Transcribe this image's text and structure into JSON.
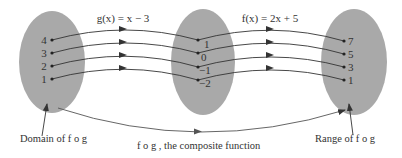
{
  "colors": {
    "ellipse_fill": "#a9a9a9",
    "line": "#333333",
    "text": "#333333",
    "background": "#ffffff"
  },
  "functions": {
    "g": {
      "label": "g(x) = x − 3"
    },
    "f": {
      "label": "f(x) = 2x + 5"
    }
  },
  "sets": {
    "domain": {
      "values": [
        "4",
        "3",
        "2",
        "1"
      ],
      "caption": "Domain of f o g"
    },
    "intermediate": {
      "values": [
        "1",
        "0",
        "−1",
        "−2"
      ]
    },
    "range": {
      "values": [
        "7",
        "5",
        "3",
        "1"
      ],
      "caption": "Range of f o g"
    }
  },
  "composite": {
    "caption": "f o g , the composite function"
  }
}
